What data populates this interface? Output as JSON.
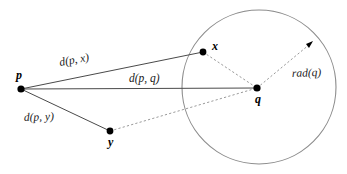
{
  "figure": {
    "background_color": "#ffffff",
    "width": 347,
    "height": 174
  },
  "colors": {
    "solid_edge": "#4a4a4a",
    "dashed_edge": "#9a9a9a",
    "circle": "#8c8c8c",
    "point": "#000000",
    "text": "#000000"
  },
  "points": [
    {
      "id": "p",
      "label": "p",
      "cx": 21,
      "cy": 89,
      "r": 3.6,
      "label_x": 16,
      "label_y": 79
    },
    {
      "id": "x",
      "label": "x",
      "cx": 203,
      "cy": 52,
      "r": 3.4,
      "label_x": 212,
      "label_y": 50
    },
    {
      "id": "q",
      "label": "q",
      "cx": 257,
      "cy": 88,
      "r": 3.6,
      "label_x": 255,
      "label_y": 103
    },
    {
      "id": "y",
      "label": "y",
      "cx": 110,
      "cy": 131,
      "r": 3.4,
      "label_x": 108,
      "label_y": 146
    }
  ],
  "circle": {
    "id": "cluster-circle",
    "cx": 259,
    "cy": 87,
    "r": 77
  },
  "solid_edges": [
    {
      "id": "p-to-x",
      "x1": 21,
      "y1": 89,
      "x2": 203,
      "y2": 52
    },
    {
      "id": "p-to-q",
      "x1": 21,
      "y1": 89,
      "x2": 257,
      "y2": 88
    },
    {
      "id": "p-to-y",
      "x1": 21,
      "y1": 89,
      "x2": 110,
      "y2": 131
    }
  ],
  "dashed_edges": [
    {
      "id": "x-to-q",
      "x1": 203,
      "y1": 52,
      "x2": 257,
      "y2": 88
    },
    {
      "id": "y-to-q",
      "x1": 110,
      "y1": 131,
      "x2": 257,
      "y2": 88
    },
    {
      "id": "q-to-rim",
      "x1": 257,
      "y1": 88,
      "x2": 312,
      "y2": 42
    }
  ],
  "radius_arrow": {
    "id": "rad-arrow",
    "tip_x": 313,
    "tip_y": 41,
    "angle_deg": -40
  },
  "edge_labels": [
    {
      "id": "label-d-p-x",
      "text": "d(p, x)",
      "x": 60,
      "y": 66,
      "rotate": -10.5
    },
    {
      "id": "label-d-p-q",
      "text": "d(p, q)",
      "x": 129,
      "y": 82,
      "rotate": 0
    },
    {
      "id": "label-d-p-y",
      "text": "d(p, y)",
      "x": 24,
      "y": 121,
      "rotate": -2
    },
    {
      "id": "label-rad-q",
      "text": "rad(q)",
      "x": 292,
      "y": 77,
      "rotate": -2
    }
  ]
}
